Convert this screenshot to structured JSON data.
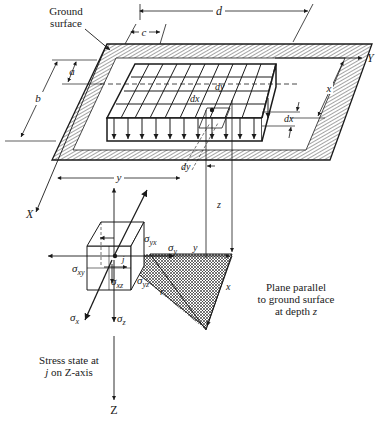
{
  "figure": {
    "labels": {
      "ground_surface_1": "Ground",
      "ground_surface_2": "surface",
      "dim_a": "a",
      "dim_b": "b",
      "dim_c": "c",
      "dim_d": "d",
      "dim_x": "x",
      "dim_y": "y",
      "dim_dx_top": "dx",
      "dim_dy_top": "dy",
      "dim_dx_right": "dx",
      "dim_dy_bottom": "dy",
      "depth_z": "z",
      "axis_X": "X",
      "axis_Y": "Y",
      "axis_Z": "Z",
      "plane_y": "y",
      "plane_x": "x",
      "plane_r": "r",
      "point_j": "j"
    },
    "stress_labels": {
      "sigma_yx": "σ",
      "sigma_yx_sub": "yx",
      "sigma_y": "σ",
      "sigma_y_sub": "y",
      "sigma_xy": "σ",
      "sigma_xy_sub": "xy",
      "sigma_xz": "σ",
      "sigma_xz_sub": "xz",
      "sigma_yz": "σ",
      "sigma_yz_sub": "yz",
      "sigma_x": "σ",
      "sigma_x_sub": "x",
      "sigma_z": "σ",
      "sigma_z_sub": "z"
    },
    "captions": {
      "plane_1": "Plane parallel",
      "plane_2": "to ground surface",
      "plane_3_prefix": "at depth ",
      "plane_3_var": "z",
      "stress_1": "Stress state at",
      "stress_2_var": "j",
      "stress_2_suffix": " on Z-axis"
    },
    "colors": {
      "ink": "#1a1a1a",
      "background": "#ffffff"
    }
  }
}
